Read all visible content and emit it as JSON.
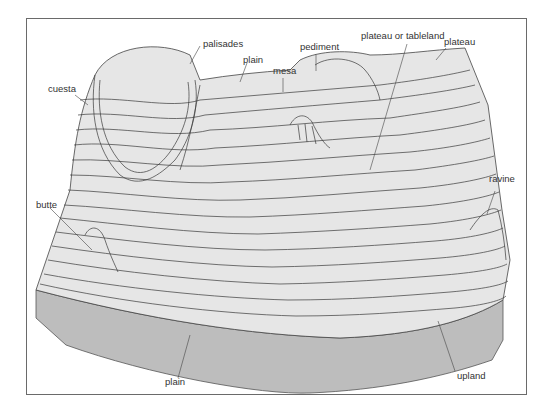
{
  "diagram": {
    "colors": {
      "surface": "#e6e6e6",
      "side": "#bdbdbd",
      "contour": "#3a3a3a",
      "frame": "#6a6a6a",
      "label": "#333333"
    },
    "labels": [
      {
        "id": "palisades",
        "text": "palisades"
      },
      {
        "id": "plain_top",
        "text": "plain"
      },
      {
        "id": "mesa",
        "text": "mesa"
      },
      {
        "id": "pediment",
        "text": "pediment"
      },
      {
        "id": "plateau_or_tableland",
        "text": "plateau or tableland"
      },
      {
        "id": "plateau",
        "text": "plateau"
      },
      {
        "id": "cuesta",
        "text": "cuesta"
      },
      {
        "id": "butte",
        "text": "butte"
      },
      {
        "id": "ravine",
        "text": "ravine"
      },
      {
        "id": "plain_bottom",
        "text": "plain"
      },
      {
        "id": "upland",
        "text": "upland"
      }
    ]
  }
}
